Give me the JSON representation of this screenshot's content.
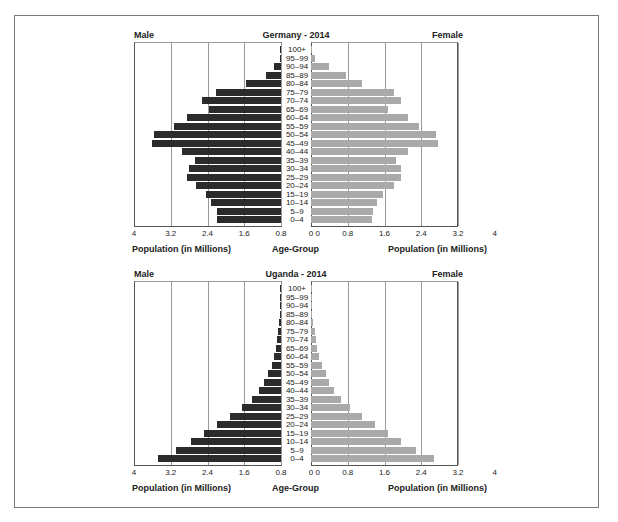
{
  "chart_data": [
    {
      "type": "bar",
      "subtype": "population-pyramid",
      "title": "Germany - 2014",
      "left_label": "Male",
      "right_label": "Female",
      "xlabel_left": "Population (in Millions)",
      "xlabel_center": "Age-Group",
      "xlabel_right": "Population (in Millions)",
      "xlim": [
        0,
        4
      ],
      "ticks_left": [
        "4",
        "3.2",
        "2.4",
        "1.6",
        "0.8",
        "0"
      ],
      "ticks_right": [
        "0",
        "0.8",
        "1.6",
        "2.4",
        "3.2",
        "4"
      ],
      "grid": true,
      "categories": [
        "100+",
        "95–99",
        "90–94",
        "85–89",
        "80–84",
        "75–79",
        "70–74",
        "65–69",
        "60–64",
        "55–59",
        "50–54",
        "45–49",
        "40–44",
        "35–39",
        "30–34",
        "25–29",
        "20–24",
        "15–19",
        "10–14",
        "5–9",
        "0–4"
      ],
      "series": [
        {
          "name": "Male",
          "color": "#2b2b2b",
          "values": [
            0.01,
            0.03,
            0.18,
            0.42,
            0.95,
            1.78,
            2.15,
            1.95,
            2.55,
            2.9,
            3.45,
            3.5,
            2.7,
            2.35,
            2.5,
            2.55,
            2.3,
            2.05,
            1.9,
            1.75,
            1.75
          ]
        },
        {
          "name": "Female",
          "color": "#a9a9a9",
          "values": [
            0.02,
            0.12,
            0.5,
            0.95,
            1.4,
            2.25,
            2.45,
            2.1,
            2.65,
            2.95,
            3.4,
            3.45,
            2.65,
            2.3,
            2.45,
            2.45,
            2.25,
            1.95,
            1.8,
            1.7,
            1.65
          ]
        }
      ]
    },
    {
      "type": "bar",
      "subtype": "population-pyramid",
      "title": "Uganda - 2014",
      "left_label": "Male",
      "right_label": "Female",
      "xlabel_left": "Population (in Millions)",
      "xlabel_center": "Age-Group",
      "xlabel_right": "Population (in Millions)",
      "xlim": [
        0,
        4
      ],
      "ticks_left": [
        "4",
        "3.2",
        "2.4",
        "1.6",
        "0.8",
        "0"
      ],
      "ticks_right": [
        "0",
        "0.8",
        "1.6",
        "2.4",
        "3.2",
        "4"
      ],
      "grid": true,
      "categories": [
        "100+",
        "95–99",
        "90–94",
        "85–89",
        "80–84",
        "75–79",
        "70–74",
        "65–69",
        "60–64",
        "55–59",
        "50–54",
        "45–49",
        "40–44",
        "35–39",
        "30–34",
        "25–29",
        "20–24",
        "15–19",
        "10–14",
        "5–9",
        "0–4"
      ],
      "series": [
        {
          "name": "Male",
          "color": "#2b2b2b",
          "values": [
            0.01,
            0.01,
            0.02,
            0.03,
            0.05,
            0.08,
            0.1,
            0.13,
            0.18,
            0.25,
            0.35,
            0.45,
            0.6,
            0.8,
            1.05,
            1.4,
            1.75,
            2.1,
            2.45,
            2.85,
            3.35
          ]
        },
        {
          "name": "Female",
          "color": "#a9a9a9",
          "values": [
            0.01,
            0.02,
            0.02,
            0.04,
            0.06,
            0.1,
            0.13,
            0.16,
            0.22,
            0.3,
            0.4,
            0.48,
            0.62,
            0.82,
            1.05,
            1.4,
            1.75,
            2.1,
            2.45,
            2.85,
            3.35
          ]
        }
      ]
    }
  ]
}
